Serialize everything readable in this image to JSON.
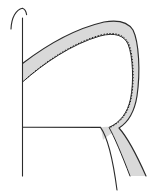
{
  "figure": {
    "background_color": "#ffffff",
    "ink_color": "#2b2b2b",
    "band_fill_color": "#d9d9d9",
    "band_edge_color": "#1c1c1c",
    "hatch_edge_color": "#1c1c1c",
    "width": 152,
    "height": 193,
    "elements": [
      {
        "name": "vertical-axis-line",
        "label": "Vertical axis line",
        "color": "#2b2b2b",
        "stroke_width": 1.1,
        "path": "M 22.5 18 L 22.5 176"
      },
      {
        "name": "top-arch-hook",
        "label": "Arch hook at top of vertical line",
        "color": "#2b2b2b",
        "stroke_width": 1.1,
        "path": "M 11 29 C 11.5 17.5, 16 9.5, 22.5 8.2 C 25.5 9.2, 26.2 12.0, 26.6 14.6"
      },
      {
        "name": "horizontal-baseline",
        "label": "Horizontal baseline",
        "color": "#2b2b2b",
        "stroke_width": 1.1,
        "path": "M 22.5 127.2 L 100.5 127.4"
      },
      {
        "name": "band-outer-edge",
        "label": "Outer edge of shaded band",
        "color": "#1c1c1c",
        "stroke_width": 1.15,
        "path": "M 22.5 63.5 C 44 47, 74 29, 104 22 C 118 19.5, 128 22, 133 30 C 139 42, 140.5 72, 137 96 C 134.5 112, 128.5 122, 119 128 C 128 138, 138 158, 146 176"
      },
      {
        "name": "band-inner-edge",
        "label": "Inner hatched edge of shaded band",
        "color": "#1c1c1c",
        "stroke_width": 1.0,
        "path": "M 22.5 82 C 44 63, 72 44, 100 36 C 115 32, 124 35.5, 128 44 C 133 56, 134 82, 130.5 99 C 127.5 113, 120 122.5, 109 127.4 C 114 136, 122 155, 130 176"
      },
      {
        "name": "band-left-cap",
        "label": "Left termination of band at vertical line",
        "color": "#1c1c1c",
        "stroke_width": 1.0,
        "path": "M 22.5 63.5 L 22.5 82"
      },
      {
        "name": "lower-descending-curve",
        "label": "Thin curve descending from junction",
        "color": "#2b2b2b",
        "stroke_width": 1.1,
        "path": "M 100.5 127.4 C 106 135, 112 152, 117 190"
      },
      {
        "name": "junction-shade",
        "label": "Shaded wedge at lower junction",
        "color": "#d9d9d9"
      }
    ]
  }
}
